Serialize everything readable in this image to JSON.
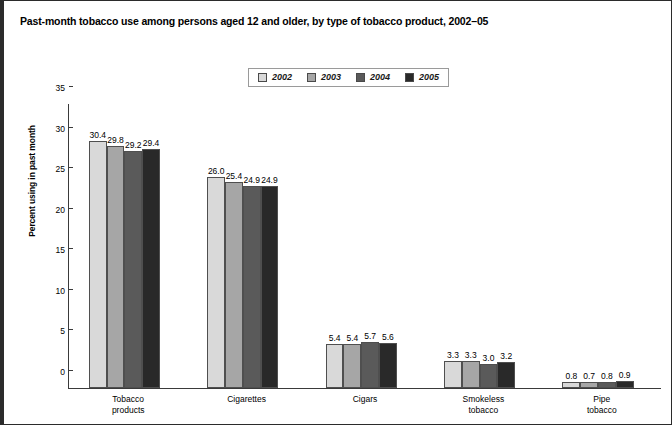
{
  "title": "Past-month tobacco use among persons aged 12 and older, by type of tobacco product, 2002–05",
  "chart_data": {
    "type": "bar",
    "title": "Past-month tobacco use among persons aged 12 and older, by type of tobacco product, 2002–05",
    "xlabel": "",
    "ylabel": "Percent using in past month",
    "ylim": [
      0,
      35
    ],
    "yticks": [
      "0",
      "5",
      "10",
      "15",
      "20",
      "25",
      "30",
      "35"
    ],
    "ytick_values": [
      0,
      5,
      10,
      15,
      20,
      25,
      30,
      35
    ],
    "grid": false,
    "legend_position": "top-center",
    "categories": [
      "Tobacco\nproducts",
      "Cigarettes",
      "Cigars",
      "Smokeless\ntobacco",
      "Pipe\ntobacco"
    ],
    "series": [
      {
        "name": "2002",
        "color": "#d9d9d9",
        "values": [
          30.4,
          26.0,
          5.4,
          3.3,
          0.8
        ],
        "labels": [
          "30.4",
          "26.0",
          "5.4",
          "3.3",
          "0.8"
        ]
      },
      {
        "name": "2003",
        "color": "#a6a6a6",
        "values": [
          29.8,
          25.4,
          5.4,
          3.3,
          0.7
        ],
        "labels": [
          "29.8",
          "25.4",
          "5.4",
          "3.3",
          "0.7"
        ]
      },
      {
        "name": "2004",
        "color": "#5a5a5a",
        "values": [
          29.2,
          24.9,
          5.7,
          3.0,
          0.8
        ],
        "labels": [
          "29.2",
          "24.9",
          "5.7",
          "3.0",
          "0.8"
        ]
      },
      {
        "name": "2005",
        "color": "#292929",
        "values": [
          29.4,
          24.9,
          5.6,
          3.2,
          0.9
        ],
        "labels": [
          "29.4",
          "24.9",
          "5.6",
          "3.2",
          "0.9"
        ]
      }
    ]
  }
}
